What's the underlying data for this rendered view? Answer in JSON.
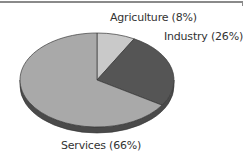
{
  "chart_data": {
    "type": "pie",
    "style": "3d-tilted",
    "title": "",
    "slices": [
      {
        "label": "Agriculture",
        "value": 8,
        "display": "Agriculture (8%)",
        "color": "#c9c9c9"
      },
      {
        "label": "Industry",
        "value": 26,
        "display": "Industry (26%)",
        "color": "#555555"
      },
      {
        "label": "Services",
        "value": 66,
        "display": "Services (66%)",
        "color": "#a9a9a9"
      }
    ],
    "side_color": "#4a4a4a",
    "legend": "none (labels beside slices)"
  }
}
